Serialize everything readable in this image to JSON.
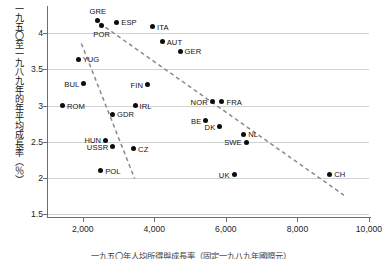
{
  "chart_data": {
    "type": "scatter",
    "title": "",
    "ylabel": "一九五〇至一九八九年的年平均成長率（％）",
    "xlabel": "",
    "caption": "一九五〇年人均所得與成長率（固定一九八九年國際元）",
    "xlim": [
      1000,
      10000
    ],
    "ylim": [
      1.5,
      4.35
    ],
    "grid": true,
    "legend": "none",
    "ytick_labels": [
      "1.5",
      "2",
      "2.5",
      "3",
      "3.5",
      "4"
    ],
    "ytick_values": [
      1.5,
      2,
      2.5,
      3,
      3.5,
      4
    ],
    "xtick_labels": [
      "2,000",
      "4,000",
      "6,000",
      "8,000",
      "10,000"
    ],
    "xtick_values": [
      2000,
      4000,
      6000,
      8000,
      10000
    ],
    "points": [
      {
        "label": "GRE",
        "x": 2420,
        "y": 4.18,
        "pos": "t"
      },
      {
        "label": "POR",
        "x": 2530,
        "y": 4.11,
        "pos": "b"
      },
      {
        "label": "ESP",
        "x": 2950,
        "y": 4.15,
        "pos": "r"
      },
      {
        "label": "ITA",
        "x": 3950,
        "y": 4.09,
        "pos": "r"
      },
      {
        "label": "AUT",
        "x": 4220,
        "y": 3.88,
        "pos": "r"
      },
      {
        "label": "GER",
        "x": 4720,
        "y": 3.75,
        "pos": "r"
      },
      {
        "label": "YUG",
        "x": 1870,
        "y": 3.64,
        "pos": "r"
      },
      {
        "label": "BUL",
        "x": 2030,
        "y": 3.3,
        "pos": "l"
      },
      {
        "label": "FIN",
        "x": 3810,
        "y": 3.29,
        "pos": "l"
      },
      {
        "label": "ROM",
        "x": 1430,
        "y": 3.0,
        "pos": "r"
      },
      {
        "label": "IRL",
        "x": 3460,
        "y": 3.0,
        "pos": "r"
      },
      {
        "label": "NOR",
        "x": 5620,
        "y": 3.05,
        "pos": "l"
      },
      {
        "label": "FRA",
        "x": 5890,
        "y": 3.05,
        "pos": "r"
      },
      {
        "label": "GDR",
        "x": 2830,
        "y": 2.88,
        "pos": "r"
      },
      {
        "label": "BE",
        "x": 5440,
        "y": 2.79,
        "pos": "l"
      },
      {
        "label": "DK",
        "x": 5830,
        "y": 2.71,
        "pos": "l"
      },
      {
        "label": "NL",
        "x": 6500,
        "y": 2.6,
        "pos": "r"
      },
      {
        "label": "HUN",
        "x": 2640,
        "y": 2.52,
        "pos": "l"
      },
      {
        "label": "SWE",
        "x": 6570,
        "y": 2.49,
        "pos": "l"
      },
      {
        "label": "USSR",
        "x": 2840,
        "y": 2.43,
        "pos": "l"
      },
      {
        "label": "CZ",
        "x": 3420,
        "y": 2.4,
        "pos": "r"
      },
      {
        "label": "POL",
        "x": 2500,
        "y": 2.1,
        "pos": "r"
      },
      {
        "label": "UK",
        "x": 6230,
        "y": 2.04,
        "pos": "l"
      },
      {
        "label": "CH",
        "x": 8900,
        "y": 2.05,
        "pos": "r"
      }
    ],
    "trend_lines": [
      {
        "name": "eastern-europe-trend",
        "style": "dashed",
        "x1": 1960,
        "y1": 3.86,
        "x2": 3450,
        "y2": 1.99
      },
      {
        "name": "western-europe-trend",
        "style": "dashed",
        "x1": 2470,
        "y1": 4.14,
        "x2": 9300,
        "y2": 1.76
      }
    ],
    "colors": {
      "point": "#0d0d0d",
      "axis": "#6e6e6e",
      "grid": "#d2d2d2",
      "trend": "#8a8a8a",
      "text": "#1a1a1a"
    }
  }
}
